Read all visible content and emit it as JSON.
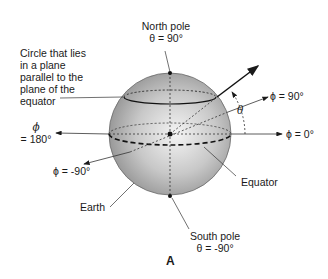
{
  "figure": {
    "panel_label": "A",
    "labels": {
      "north_pole": "North pole",
      "north_theta": "θ = 90°",
      "south_pole": "South pole",
      "south_theta": "θ = -90°",
      "circle_line1": "Circle that lies",
      "circle_line2": "in a plane",
      "circle_line3": "parallel to the",
      "circle_line4": "plane of the",
      "circle_line5": "equator",
      "phi_180_sym": "ϕ",
      "phi_180_val": "= 180°",
      "phi_neg90": "ϕ = -90°",
      "phi_90": "ϕ = 90°",
      "phi_0": "ϕ = 0°",
      "theta": "θ",
      "earth": "Earth",
      "equator": "Equator"
    },
    "colors": {
      "sphere_light": "#f2f2f2",
      "sphere_dark": "#8c8c8c",
      "line": "#1a1a1a"
    }
  }
}
